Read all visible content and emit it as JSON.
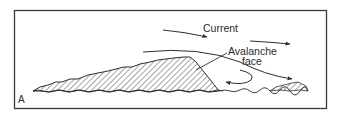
{
  "figure": {
    "panel_label": "A",
    "labels": {
      "current": "Current",
      "avalanche_line1": "Avalanche",
      "avalanche_line2": "face"
    },
    "colors": {
      "stroke": "#2e2e2e",
      "frame": "#3a3a3a",
      "background": "#ffffff"
    }
  }
}
